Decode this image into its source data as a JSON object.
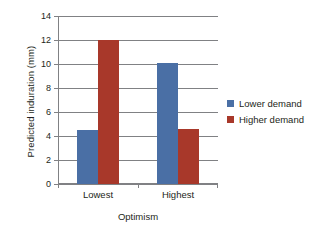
{
  "chart_data": {
    "type": "bar",
    "title": "",
    "xlabel": "Optimism",
    "ylabel": "Predicted induration (mm)",
    "categories": [
      "Lowest",
      "Highest"
    ],
    "series": [
      {
        "name": "Lower demand",
        "color": "#4a6fa5",
        "values": [
          4.5,
          10.1
        ]
      },
      {
        "name": "Higher demand",
        "color": "#a8382a",
        "values": [
          12.0,
          4.6
        ]
      }
    ],
    "ylim": [
      0,
      14
    ],
    "ytick_labels": [
      "0",
      "2",
      "4",
      "6",
      "8",
      "10",
      "12",
      "14"
    ],
    "ytick_values": [
      0,
      2,
      4,
      6,
      8,
      10,
      12,
      14
    ],
    "grid": "horizontal",
    "legend_position": "right",
    "grid_color": "#808184",
    "axis_color": "#808184",
    "text_color": "#231f20",
    "background": "#ffffff"
  },
  "axes": {
    "y_title": "Predicted induration (mm)",
    "x_title": "Optimism"
  },
  "legend": {
    "items": [
      {
        "label": "Lower demand",
        "color": "#4a6fa5"
      },
      {
        "label": "Higher demand",
        "color": "#a8382a"
      }
    ]
  },
  "ticks": {
    "y": [
      "0",
      "2",
      "4",
      "6",
      "8",
      "10",
      "12",
      "14"
    ],
    "x": [
      "Lowest",
      "Highest"
    ]
  }
}
